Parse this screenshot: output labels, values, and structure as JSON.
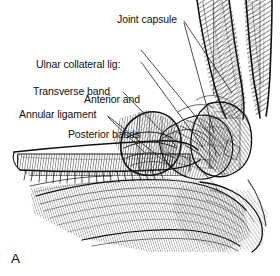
{
  "figure": {
    "panel_letter": "A",
    "style": "pen-and-ink-line-drawing",
    "ink_color": "#111111",
    "background_color": "#ffffff"
  },
  "labels": {
    "joint_capsule": "Joint capsule",
    "ulnar_collateral_lig": "Ulnar collateral lig:",
    "anterior_and": "Anterior and",
    "posterior_bands": "Posterior bands",
    "transverse_band": "Transverse band",
    "annular_ligament": "Annular ligament"
  },
  "leader_lines": [
    {
      "name": "joint-capsule-upper",
      "from": [
        183,
        22
      ],
      "to": [
        230,
        94
      ]
    },
    {
      "name": "joint-capsule-lower",
      "from": [
        183,
        23
      ],
      "to": [
        213,
        132
      ]
    },
    {
      "name": "anterior-band",
      "from": [
        140,
        50
      ],
      "to": [
        214,
        139
      ]
    },
    {
      "name": "posterior-band",
      "from": [
        140,
        62
      ],
      "to": [
        203,
        146
      ]
    },
    {
      "name": "transverse-band",
      "from": [
        122,
        92
      ],
      "to": [
        176,
        147
      ]
    },
    {
      "name": "annular-ligament",
      "from": [
        107,
        116
      ],
      "to": [
        163,
        160
      ]
    },
    {
      "name": "annular-ligament-b",
      "from": [
        107,
        117
      ],
      "to": [
        143,
        151
      ]
    }
  ],
  "anatomy_parts": [
    "humerus-shaft",
    "medial-epicondyle",
    "ulna-shaft",
    "radius-shaft",
    "olecranon",
    "radial-head",
    "annular-ligament-band",
    "ulnar-collateral-ligament",
    "joint-capsule"
  ]
}
